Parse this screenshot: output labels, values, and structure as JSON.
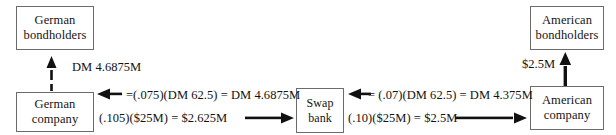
{
  "diagram": {
    "background_color": "#ffffff",
    "ink_color": "#111111",
    "border_color": "#6b6b6b"
  },
  "nodes": {
    "german_bondholders": {
      "line1": "German",
      "line2": "bondholders"
    },
    "german_company": {
      "line1": "German",
      "line2": "company"
    },
    "swap_bank": {
      "line1": "Swap",
      "line2": "bank"
    },
    "american_bondholders": {
      "line1": "American",
      "line2": "bondholders"
    },
    "american_company": {
      "line1": "American",
      "line2": "company"
    }
  },
  "flows": {
    "german_to_bondholders": {
      "label": "DM 4.6875M",
      "direction": "up",
      "from": "German company",
      "to": "German bondholders"
    },
    "bank_to_german": {
      "label": "=(.075)(DM 62.5) = DM 4.6875M",
      "direction": "left",
      "from": "Swap bank",
      "to": "German company",
      "rate": ".075",
      "principal": "DM 62.5",
      "amount": "DM 4.6875M"
    },
    "german_to_bank": {
      "label": "(.105)($25M) = $2.625M",
      "direction": "right",
      "from": "German company",
      "to": "Swap bank",
      "rate": ".105",
      "principal": "$25M",
      "amount": "$2.625M"
    },
    "bank_to_american": {
      "label": "= (.07)(DM 62.5) = DM 4.375M",
      "direction": "left",
      "from": "American company",
      "to": "Swap bank",
      "rate": ".07",
      "principal": "DM 62.5",
      "amount": "DM 4.375M"
    },
    "american_to_bank": {
      "label": "(.10)($25M) = $2.5M",
      "direction": "right",
      "from": "American company",
      "to": "Swap bank",
      "rate": ".10",
      "principal": "$25M",
      "amount": "$2.5M"
    },
    "american_to_bondholders": {
      "label": "$2.5M",
      "direction": "up",
      "from": "American company",
      "to": "American bondholders"
    }
  }
}
